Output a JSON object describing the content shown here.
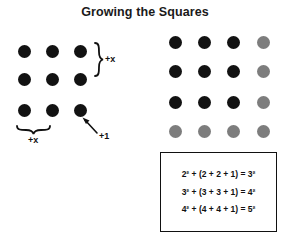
{
  "title": "Growing the Squares",
  "left_figure": {
    "name": "left-dot-grid",
    "rows": 3,
    "cols": 3,
    "dot_color": "#121212",
    "dots": [
      {
        "row": 0,
        "col": 0,
        "color": "black"
      },
      {
        "row": 0,
        "col": 1,
        "color": "black"
      },
      {
        "row": 0,
        "col": 2,
        "color": "black"
      },
      {
        "row": 1,
        "col": 0,
        "color": "black"
      },
      {
        "row": 1,
        "col": 1,
        "color": "black"
      },
      {
        "row": 1,
        "col": 2,
        "color": "black"
      },
      {
        "row": 2,
        "col": 0,
        "color": "black"
      },
      {
        "row": 2,
        "col": 1,
        "color": "black"
      },
      {
        "row": 2,
        "col": 2,
        "color": "black"
      }
    ],
    "annotations": {
      "right_brace_label": "+x",
      "bottom_brace_label": "+x",
      "corner_arrow_label": "+1"
    }
  },
  "right_figure": {
    "name": "right-dot-grid",
    "rows": 4,
    "cols": 4,
    "black_color": "#121212",
    "gray_color": "#7d7d7d",
    "dots": [
      {
        "row": 0,
        "col": 0,
        "color": "black"
      },
      {
        "row": 0,
        "col": 1,
        "color": "black"
      },
      {
        "row": 0,
        "col": 2,
        "color": "black"
      },
      {
        "row": 0,
        "col": 3,
        "color": "gray"
      },
      {
        "row": 1,
        "col": 0,
        "color": "black"
      },
      {
        "row": 1,
        "col": 1,
        "color": "black"
      },
      {
        "row": 1,
        "col": 2,
        "color": "black"
      },
      {
        "row": 1,
        "col": 3,
        "color": "gray"
      },
      {
        "row": 2,
        "col": 0,
        "color": "black"
      },
      {
        "row": 2,
        "col": 1,
        "color": "black"
      },
      {
        "row": 2,
        "col": 2,
        "color": "black"
      },
      {
        "row": 2,
        "col": 3,
        "color": "gray"
      },
      {
        "row": 3,
        "col": 0,
        "color": "gray"
      },
      {
        "row": 3,
        "col": 1,
        "color": "gray"
      },
      {
        "row": 3,
        "col": 2,
        "color": "gray"
      },
      {
        "row": 3,
        "col": 3,
        "color": "gray"
      }
    ]
  },
  "equation_box": {
    "border_color": "#111111",
    "lines": [
      "2² + (2 + 2 + 1) = 3²",
      "3² + (3 + 3 + 1) = 4²",
      "4² + (4 + 4 + 1) = 5²"
    ]
  }
}
